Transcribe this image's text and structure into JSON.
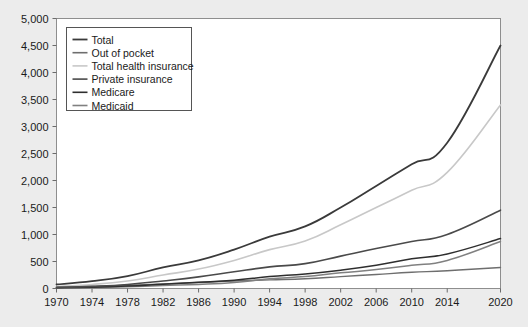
{
  "chart_data": {
    "type": "line",
    "title": "",
    "xlabel": "",
    "ylabel": "",
    "xlim": [
      1970,
      2020
    ],
    "ylim": [
      0,
      5000
    ],
    "grid": false,
    "legend_position": "top-left",
    "x_tick_labels": [
      "1970",
      "1974",
      "1978",
      "1982",
      "1986",
      "1990",
      "1994",
      "1998",
      "2002",
      "2006",
      "2010",
      "2014",
      "2020"
    ],
    "x_tick_values": [
      1970,
      1974,
      1978,
      1982,
      1986,
      1990,
      1994,
      1998,
      2002,
      2006,
      2010,
      2014,
      2020
    ],
    "y_tick_labels": [
      "0",
      "500",
      "1,000",
      "1,500",
      "2,000",
      "2,500",
      "3,000",
      "3,500",
      "4,000",
      "4,500",
      "5,000"
    ],
    "y_tick_values": [
      0,
      500,
      1000,
      1500,
      2000,
      2500,
      3000,
      3500,
      4000,
      4500,
      5000
    ],
    "x": [
      1970,
      1974,
      1978,
      1982,
      1986,
      1990,
      1994,
      1998,
      2002,
      2006,
      2010,
      2014,
      2020
    ],
    "series": [
      {
        "name": "Total",
        "color": "#3a3a3a",
        "width": 1.8,
        "values": [
          75,
          135,
          230,
          390,
          520,
          720,
          960,
          1150,
          1500,
          1900,
          2300,
          2700,
          4500
        ]
      },
      {
        "name": "Out of pocket",
        "color": "#6e6e6e",
        "width": 1.4,
        "values": [
          25,
          40,
          60,
          85,
          110,
          140,
          160,
          180,
          220,
          260,
          300,
          330,
          390
        ]
      },
      {
        "name": "Total health insurance",
        "color": "#c8c8c8",
        "width": 1.6,
        "values": [
          40,
          75,
          140,
          250,
          360,
          520,
          720,
          880,
          1180,
          1500,
          1820,
          2150,
          3400
        ]
      },
      {
        "name": "Private insurance",
        "color": "#4a4a4a",
        "width": 1.6,
        "values": [
          20,
          40,
          75,
          140,
          215,
          310,
          400,
          460,
          600,
          740,
          870,
          1000,
          1450
        ]
      },
      {
        "name": "Medicare",
        "color": "#2e2e2e",
        "width": 1.5,
        "values": [
          12,
          25,
          45,
          80,
          115,
          155,
          220,
          270,
          340,
          430,
          550,
          640,
          925
        ]
      },
      {
        "name": "Medicaid",
        "color": "#808080",
        "width": 1.5,
        "values": [
          8,
          18,
          32,
          55,
          75,
          110,
          180,
          220,
          290,
          350,
          430,
          520,
          870
        ]
      }
    ]
  },
  "legend": {
    "items": [
      {
        "label": "Total"
      },
      {
        "label": "Out of pocket"
      },
      {
        "label": "Total health insurance"
      },
      {
        "label": "Private insurance"
      },
      {
        "label": "Medicare"
      },
      {
        "label": "Medicaid"
      }
    ]
  }
}
